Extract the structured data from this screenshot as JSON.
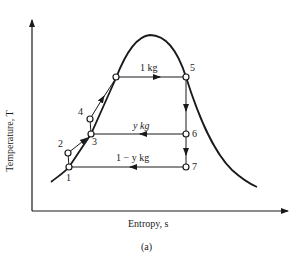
{
  "figure": {
    "caption": "(a)",
    "x_axis_label": "Entropy, s",
    "y_axis_label": "Temperature, T",
    "type": "T-s diagram, two-stage regenerative/flash cycle"
  },
  "states": [
    {
      "id": "1",
      "label": "1"
    },
    {
      "id": "2",
      "label": "2"
    },
    {
      "id": "3",
      "label": "3"
    },
    {
      "id": "4",
      "label": "4"
    },
    {
      "id": "5",
      "label": "5"
    },
    {
      "id": "6",
      "label": "6"
    },
    {
      "id": "7",
      "label": "7"
    }
  ],
  "flows": {
    "top": "1 kg",
    "middle": "y kg",
    "bottom": "1 − y kg"
  },
  "colors": {
    "line": "#1a1a1a",
    "background": "#ffffff"
  }
}
